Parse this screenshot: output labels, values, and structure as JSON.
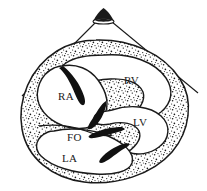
{
  "figure": {
    "type": "anatomical-line-diagram",
    "background_color": "#ffffff",
    "ink_color": "#1a1a1a",
    "wall_fill_color": "#ffffff",
    "stipple_color": "#1a1a1a",
    "valve_fill_color": "#111111",
    "width": 207,
    "height": 191
  },
  "labels": [
    {
      "id": "ra",
      "text": "RA",
      "name": "right-atrium",
      "x": 58,
      "y": 100
    },
    {
      "id": "rv",
      "text": "RV",
      "name": "right-ventricle",
      "x": 124,
      "y": 84
    },
    {
      "id": "lv",
      "text": "LV",
      "name": "left-ventricle",
      "x": 133,
      "y": 126
    },
    {
      "id": "fo",
      "text": "FO",
      "name": "fossa-ovalis",
      "x": 67,
      "y": 141
    },
    {
      "id": "la",
      "text": "LA",
      "name": "left-atrium",
      "x": 62,
      "y": 162
    }
  ],
  "markers": {
    "apex_probe": "filled-arrowhead-marker",
    "pointer_lines": 2
  }
}
